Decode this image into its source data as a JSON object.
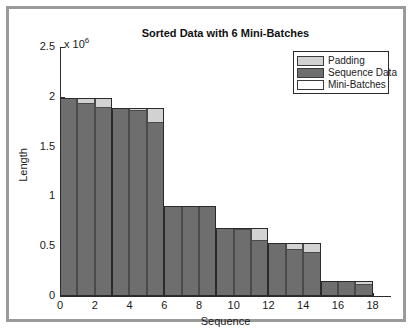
{
  "figure": {
    "title": "Sorted Data with 6 Mini-Batches",
    "exponent_prefix": "x 10",
    "exponent_power": "6"
  },
  "legend": {
    "items": [
      {
        "label": "Padding",
        "color": "#d2d2d2"
      },
      {
        "label": "Sequence Data",
        "color": "#6e6e6e"
      },
      {
        "label": "Mini-Batches",
        "color": "#ffffff"
      }
    ]
  },
  "chart_data": {
    "type": "bar",
    "title": "Sorted Data with 6 Mini-Batches",
    "xlabel": "Sequence",
    "ylabel": "Length",
    "y_scale_factor": 1000000,
    "y_exponent_label": "x 10^6",
    "xlim": [
      0,
      19
    ],
    "ylim": [
      0,
      2500000
    ],
    "ytick_values": [
      0,
      500000,
      1000000,
      1500000,
      2000000,
      2500000
    ],
    "ytick_labels": [
      "0",
      "0.5",
      "1",
      "1.5",
      "2",
      "2.5"
    ],
    "xtick_values": [
      0,
      2,
      4,
      6,
      8,
      10,
      12,
      14,
      16,
      18
    ],
    "xtick_labels": [
      "0",
      "2",
      "4",
      "6",
      "8",
      "10",
      "12",
      "14",
      "16",
      "18"
    ],
    "grid": false,
    "legend_position": "top-right",
    "mini_batch_count": 6,
    "mini_batch_size": 3,
    "x": [
      1,
      2,
      3,
      4,
      5,
      6,
      7,
      8,
      9,
      10,
      11,
      12,
      13,
      14,
      15,
      16,
      17,
      18
    ],
    "series": [
      {
        "name": "Sequence Data",
        "color": "#6e6e6e",
        "values": [
          1990000,
          1935000,
          1895000,
          1890000,
          1870000,
          1745000,
          900000,
          900000,
          900000,
          680000,
          675000,
          565000,
          530000,
          475000,
          440000,
          150000,
          150000,
          125000
        ]
      },
      {
        "name": "Padding",
        "color": "#d2d2d2",
        "values": [
          0,
          55000,
          95000,
          0,
          20000,
          145000,
          0,
          0,
          0,
          0,
          5000,
          115000,
          0,
          55000,
          90000,
          0,
          0,
          25000
        ]
      }
    ],
    "mini_batches": [
      {
        "index": 1,
        "sequences": [
          1,
          2,
          3
        ],
        "batch_max": 1990000
      },
      {
        "index": 2,
        "sequences": [
          4,
          5,
          6
        ],
        "batch_max": 1890000
      },
      {
        "index": 3,
        "sequences": [
          7,
          8,
          9
        ],
        "batch_max": 900000
      },
      {
        "index": 4,
        "sequences": [
          10,
          11,
          12
        ],
        "batch_max": 680000
      },
      {
        "index": 5,
        "sequences": [
          13,
          14,
          15
        ],
        "batch_max": 530000
      },
      {
        "index": 6,
        "sequences": [
          16,
          17,
          18
        ],
        "batch_max": 150000
      }
    ]
  }
}
